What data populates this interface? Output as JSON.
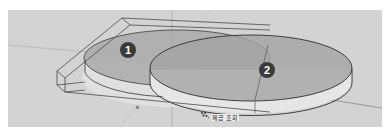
{
  "viewport": {
    "background": "#d3d3d3",
    "grid_line_color": "#b8b8b8",
    "edge_color": "#3a3a3a",
    "face_fill": "#b0b0b0",
    "side_fill": "#e2e2e2"
  },
  "objects": [
    {
      "id": 1,
      "type": "cylinder-disk",
      "badge": "1"
    },
    {
      "id": 2,
      "type": "cylinder-disk",
      "badge": "2"
    }
  ],
  "badges": [
    {
      "label": "1",
      "color": "#3b3b3b",
      "text_color": "#ffffff"
    },
    {
      "label": "2",
      "color": "#3b3b3b",
      "text_color": "#ffffff"
    }
  ],
  "cursor": {
    "icon": "snap-cursor-icon",
    "label": "제곱 조회"
  }
}
